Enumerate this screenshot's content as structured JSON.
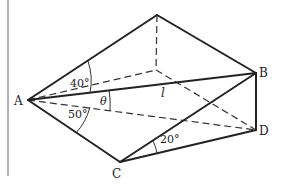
{
  "diagram": {
    "type": "3D geometry figure (wedge / triangular prism)",
    "points": {
      "A": {
        "label": "A"
      },
      "B": {
        "label": "B"
      },
      "C": {
        "label": "C"
      },
      "D": {
        "label": "D"
      }
    },
    "segment_labels": {
      "AB": "l"
    },
    "angles": {
      "upper_at_A": "40°",
      "lower_at_A": "50°",
      "theta_at_A": "θ",
      "at_C": "20°"
    }
  }
}
